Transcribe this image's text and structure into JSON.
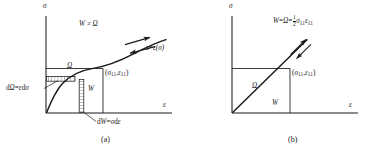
{
  "figure": {
    "type": "technical-diagram",
    "panels": [
      {
        "id": "a",
        "caption": "(a)",
        "axes": {
          "y_label": "σ",
          "x_label": "ε"
        },
        "relation_note": "W ≠ Ω",
        "curve_label": {
          "lhs": "ε",
          "eq": "=",
          "rhs": "ε(σ)"
        },
        "curve_type": "nonlinear",
        "arrows": [
          {
            "name": "loading-arrow",
            "direction": "right"
          },
          {
            "name": "unloading-arrow",
            "direction": "left"
          }
        ],
        "point_label": {
          "open": "(",
          "x": "σ",
          "xsub": "11",
          "comma": ",",
          "y": "ε",
          "ysub": "11",
          "close": ")"
        },
        "regions": [
          {
            "name": "omega-region",
            "label": "Ω"
          },
          {
            "name": "w-region",
            "label": "W"
          }
        ],
        "increments": [
          {
            "name": "d-omega-strip",
            "label_d": "d",
            "label_sym": "Ω",
            "eq": "=",
            "rhs_a": "ε",
            "rhs_d": "d",
            "rhs_b": "σ",
            "orientation": "horizontal"
          },
          {
            "name": "d-w-strip",
            "label_d": "d",
            "label_sym": "W",
            "eq": "=",
            "rhs_a": "σ",
            "rhs_d": "d",
            "rhs_b": "ε",
            "orientation": "vertical"
          }
        ]
      },
      {
        "id": "b",
        "caption": "(b)",
        "axes": {
          "y_label": "σ",
          "x_label": "ε"
        },
        "relation_note": {
          "w": "W",
          "eq1": "=",
          "omega": "Ω",
          "eq2": "=",
          "frac_num": "1",
          "frac_den": "2",
          "s": "σ",
          "ssub": "11",
          "e": "ε",
          "esub": "11"
        },
        "curve_type": "linear",
        "arrows": [
          {
            "name": "loading-arrow",
            "direction": "up-right"
          },
          {
            "name": "unloading-arrow",
            "direction": "down-left"
          }
        ],
        "point_label": {
          "open": "(",
          "x": "σ",
          "xsub": "11",
          "comma": ",",
          "y": "ε",
          "ysub": "11",
          "close": ")"
        },
        "regions": [
          {
            "name": "omega-region",
            "label": "Ω"
          },
          {
            "name": "w-region",
            "label": "W"
          }
        ]
      }
    ],
    "colors": {
      "ink": "#1a1a1a",
      "background": "#ffffff",
      "hatch": "#2b2b2b"
    }
  }
}
